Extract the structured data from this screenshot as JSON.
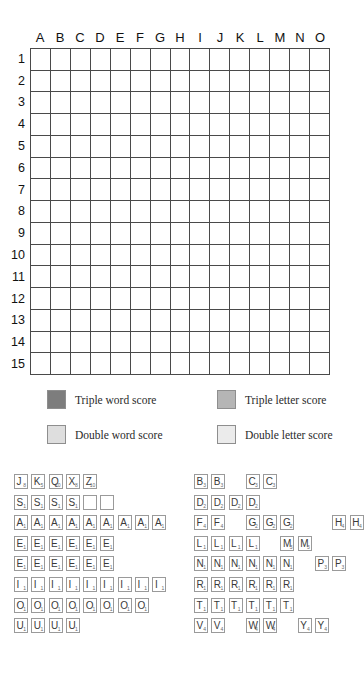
{
  "board": {
    "title": "Scrabble board",
    "columns": [
      "A",
      "B",
      "C",
      "D",
      "E",
      "F",
      "G",
      "H",
      "I",
      "J",
      "K",
      "L",
      "M",
      "N",
      "O"
    ],
    "rows": [
      "1",
      "2",
      "3",
      "4",
      "5",
      "6",
      "7",
      "8",
      "9",
      "10",
      "11",
      "12",
      "13",
      "14",
      "15"
    ],
    "premium_colors": {
      "triple_word": "#7d7d7d",
      "triple_letter": "#b5b5b5",
      "double_word": "#dedede",
      "double_letter": "#ebebeb",
      "plain": "#ffffff",
      "grid_line": "#4a4a4a"
    },
    "cells": [
      [
        "tw",
        "",
        "",
        "dl",
        "",
        "",
        "",
        "tw",
        "",
        "",
        "",
        "dl",
        "",
        "",
        "tw"
      ],
      [
        "",
        "dw",
        "",
        "",
        "",
        "tl",
        "",
        "",
        "",
        "tl",
        "",
        "",
        "",
        "dw",
        ""
      ],
      [
        "",
        "",
        "dw",
        "",
        "",
        "",
        "dl",
        "",
        "dl",
        "",
        "",
        "",
        "dw",
        "",
        ""
      ],
      [
        "dl",
        "",
        "",
        "dw",
        "",
        "",
        "",
        "dl",
        "",
        "",
        "",
        "dw",
        "",
        "",
        "dl"
      ],
      [
        "",
        "",
        "",
        "",
        "dw",
        "",
        "",
        "",
        "",
        "",
        "dw",
        "",
        "",
        "",
        ""
      ],
      [
        "",
        "tl",
        "",
        "",
        "",
        "tl",
        "",
        "",
        "",
        "tl",
        "",
        "",
        "",
        "tl",
        ""
      ],
      [
        "",
        "",
        "dl",
        "",
        "",
        "",
        "dl",
        "",
        "dl",
        "",
        "",
        "",
        "dl",
        "",
        ""
      ],
      [
        "tw",
        "",
        "",
        "dl",
        "",
        "",
        "",
        "dw",
        "",
        "",
        "",
        "dl",
        "",
        "",
        "tw"
      ],
      [
        "",
        "",
        "dl",
        "",
        "",
        "",
        "dl",
        "",
        "dl",
        "",
        "",
        "",
        "dl",
        "",
        ""
      ],
      [
        "",
        "tl",
        "",
        "",
        "",
        "tl",
        "",
        "",
        "",
        "tl",
        "",
        "",
        "",
        "tl",
        ""
      ],
      [
        "",
        "",
        "",
        "",
        "dw",
        "",
        "",
        "",
        "",
        "",
        "dw",
        "",
        "",
        "",
        ""
      ],
      [
        "dl",
        "",
        "",
        "dw",
        "",
        "",
        "",
        "dl",
        "",
        "",
        "",
        "dw",
        "",
        "",
        "dl"
      ],
      [
        "",
        "",
        "dw",
        "",
        "",
        "",
        "dl",
        "",
        "dl",
        "",
        "",
        "",
        "dw",
        "",
        ""
      ],
      [
        "",
        "dw",
        "",
        "",
        "",
        "tl",
        "",
        "",
        "",
        "tl",
        "",
        "",
        "",
        "dw",
        ""
      ],
      [
        "tw",
        "",
        "",
        "dl",
        "",
        "",
        "",
        "tw",
        "",
        "",
        "",
        "dl",
        "",
        "",
        "tw"
      ]
    ]
  },
  "legend": {
    "triple_word": "Triple word score",
    "triple_letter": "Triple letter score",
    "double_word": "Double word score",
    "double_letter": "Double letter score"
  },
  "tile_distribution": {
    "left_column": [
      {
        "row": "high-value",
        "tiles": [
          {
            "letter": "J",
            "value": "8"
          },
          {
            "letter": "K",
            "value": "5"
          },
          {
            "letter": "Q",
            "value": "10"
          },
          {
            "letter": "X",
            "value": "8"
          },
          {
            "letter": "Z",
            "value": "10"
          }
        ]
      },
      {
        "row": "s-and-blanks",
        "tiles": [
          {
            "letter": "S",
            "value": "1"
          },
          {
            "letter": "S",
            "value": "1"
          },
          {
            "letter": "S",
            "value": "1"
          },
          {
            "letter": "S",
            "value": "1"
          },
          {
            "letter": "",
            "value": "",
            "blank": true
          },
          {
            "letter": "",
            "value": "",
            "blank": true
          }
        ]
      },
      {
        "row": "a-row",
        "tiles": [
          {
            "letter": "A",
            "value": "1"
          },
          {
            "letter": "A",
            "value": "1"
          },
          {
            "letter": "A",
            "value": "1"
          },
          {
            "letter": "A",
            "value": "1"
          },
          {
            "letter": "A",
            "value": "1"
          },
          {
            "letter": "A",
            "value": "1"
          },
          {
            "letter": "A",
            "value": "1"
          },
          {
            "letter": "A",
            "value": "1"
          },
          {
            "letter": "A",
            "value": "1"
          }
        ]
      },
      {
        "row": "e-row-1",
        "tiles": [
          {
            "letter": "E",
            "value": "1"
          },
          {
            "letter": "E",
            "value": "1"
          },
          {
            "letter": "E",
            "value": "1"
          },
          {
            "letter": "E",
            "value": "1"
          },
          {
            "letter": "E",
            "value": "1"
          },
          {
            "letter": "E",
            "value": "1"
          }
        ]
      },
      {
        "row": "e-row-2",
        "tiles": [
          {
            "letter": "E",
            "value": "1"
          },
          {
            "letter": "E",
            "value": "1"
          },
          {
            "letter": "E",
            "value": "1"
          },
          {
            "letter": "E",
            "value": "1"
          },
          {
            "letter": "E",
            "value": "1"
          },
          {
            "letter": "E",
            "value": "1"
          }
        ]
      },
      {
        "row": "i-row",
        "tiles": [
          {
            "letter": "I",
            "value": "1"
          },
          {
            "letter": "I",
            "value": "1"
          },
          {
            "letter": "I",
            "value": "1"
          },
          {
            "letter": "I",
            "value": "1"
          },
          {
            "letter": "I",
            "value": "1"
          },
          {
            "letter": "I",
            "value": "1"
          },
          {
            "letter": "I",
            "value": "1"
          },
          {
            "letter": "I",
            "value": "1"
          },
          {
            "letter": "I",
            "value": "1"
          }
        ]
      },
      {
        "row": "o-row",
        "tiles": [
          {
            "letter": "O",
            "value": "1"
          },
          {
            "letter": "O",
            "value": "1"
          },
          {
            "letter": "O",
            "value": "1"
          },
          {
            "letter": "O",
            "value": "1"
          },
          {
            "letter": "O",
            "value": "1"
          },
          {
            "letter": "O",
            "value": "1"
          },
          {
            "letter": "O",
            "value": "1"
          },
          {
            "letter": "O",
            "value": "1"
          }
        ]
      },
      {
        "row": "u-row",
        "tiles": [
          {
            "letter": "U",
            "value": "1"
          },
          {
            "letter": "U",
            "value": "1"
          },
          {
            "letter": "U",
            "value": "1"
          },
          {
            "letter": "U",
            "value": "1"
          }
        ]
      }
    ],
    "right_column": [
      {
        "row": "b-c-row",
        "tiles": [
          {
            "letter": "B",
            "value": "3"
          },
          {
            "letter": "B",
            "value": "3"
          },
          {
            "gap": true
          },
          {
            "letter": "C",
            "value": "3"
          },
          {
            "letter": "C",
            "value": "3"
          }
        ]
      },
      {
        "row": "d-row",
        "tiles": [
          {
            "letter": "D",
            "value": "2"
          },
          {
            "letter": "D",
            "value": "2"
          },
          {
            "letter": "D",
            "value": "2"
          },
          {
            "letter": "D",
            "value": "2"
          }
        ]
      },
      {
        "row": "f-g-h-row",
        "tiles": [
          {
            "letter": "F",
            "value": "4"
          },
          {
            "letter": "F",
            "value": "4"
          },
          {
            "gap": true
          },
          {
            "letter": "G",
            "value": "2"
          },
          {
            "letter": "G",
            "value": "2"
          },
          {
            "letter": "G",
            "value": "2"
          },
          {
            "gap": true
          },
          {
            "gap": true
          },
          {
            "letter": "H",
            "value": "4"
          },
          {
            "letter": "H",
            "value": "4"
          }
        ]
      },
      {
        "row": "l-m-row",
        "tiles": [
          {
            "letter": "L",
            "value": "1"
          },
          {
            "letter": "L",
            "value": "1"
          },
          {
            "letter": "L",
            "value": "1"
          },
          {
            "letter": "L",
            "value": "1"
          },
          {
            "gap": true
          },
          {
            "letter": "M",
            "value": "3"
          },
          {
            "letter": "M",
            "value": "3"
          }
        ]
      },
      {
        "row": "n-p-row",
        "tiles": [
          {
            "letter": "N",
            "value": "1"
          },
          {
            "letter": "N",
            "value": "1"
          },
          {
            "letter": "N",
            "value": "1"
          },
          {
            "letter": "N",
            "value": "1"
          },
          {
            "letter": "N",
            "value": "1"
          },
          {
            "letter": "N",
            "value": "1"
          },
          {
            "gap": true
          },
          {
            "letter": "P",
            "value": "3"
          },
          {
            "letter": "P",
            "value": "3"
          }
        ]
      },
      {
        "row": "r-row",
        "tiles": [
          {
            "letter": "R",
            "value": "1"
          },
          {
            "letter": "R",
            "value": "1"
          },
          {
            "letter": "R",
            "value": "1"
          },
          {
            "letter": "R",
            "value": "1"
          },
          {
            "letter": "R",
            "value": "1"
          },
          {
            "letter": "R",
            "value": "1"
          }
        ]
      },
      {
        "row": "t-row",
        "tiles": [
          {
            "letter": "T",
            "value": "1"
          },
          {
            "letter": "T",
            "value": "1"
          },
          {
            "letter": "T",
            "value": "1"
          },
          {
            "letter": "T",
            "value": "1"
          },
          {
            "letter": "T",
            "value": "1"
          },
          {
            "letter": "T",
            "value": "1"
          }
        ]
      },
      {
        "row": "v-w-y-row",
        "tiles": [
          {
            "letter": "V",
            "value": "4"
          },
          {
            "letter": "V",
            "value": "4"
          },
          {
            "gap": true
          },
          {
            "letter": "W",
            "value": "4"
          },
          {
            "letter": "W",
            "value": "4"
          },
          {
            "gap": true
          },
          {
            "letter": "Y",
            "value": "4"
          },
          {
            "letter": "Y",
            "value": "4"
          }
        ]
      }
    ]
  }
}
